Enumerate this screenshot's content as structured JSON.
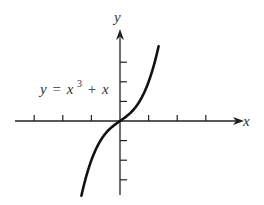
{
  "chart_data": {
    "type": "line",
    "title": "",
    "annotation": "y = x³ + x",
    "equation": {
      "lhs": "y",
      "eq": "=",
      "base": "x",
      "exp": "3",
      "rest": "+ x"
    },
    "xlabel": "x",
    "ylabel": "y",
    "grid": false,
    "xlim": [
      -4,
      4.5
    ],
    "ylim": [
      -4,
      4.6
    ],
    "x_ticks": [
      -3,
      -2,
      -1,
      1,
      2,
      3
    ],
    "y_ticks": [
      -3,
      -2,
      -1,
      1,
      2,
      3
    ],
    "series": [
      {
        "name": "y = x^3 + x",
        "x": [
          -1.35,
          -1.2,
          -1.0,
          -0.8,
          -0.6,
          -0.4,
          -0.2,
          0,
          0.2,
          0.4,
          0.6,
          0.8,
          1.0,
          1.2,
          1.35
        ],
        "y": [
          -3.81,
          -2.93,
          -2.0,
          -1.31,
          -0.82,
          -0.46,
          -0.21,
          0,
          0.21,
          0.46,
          0.82,
          1.31,
          2.0,
          2.93,
          3.81
        ]
      }
    ]
  },
  "colors": {
    "axis": "#222222",
    "curve": "#111111",
    "text": "#333333"
  }
}
